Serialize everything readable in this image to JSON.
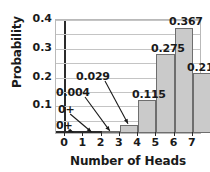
{
  "chart_data": {
    "type": "bar",
    "title": "",
    "xlabel": "Number of Heads",
    "ylabel": "Probability",
    "categories": [
      "0",
      "1",
      "2",
      "3",
      "4",
      "5",
      "6",
      "7"
    ],
    "values": [
      0,
      0,
      0.004,
      0.029,
      0.115,
      0.275,
      0.367,
      0.21
    ],
    "value_labels": [
      "0+",
      "0+",
      "0.004",
      "0.029",
      "0.115",
      "0.275",
      "0.367",
      "0.210"
    ],
    "ylim": [
      0,
      0.4
    ],
    "yticks": [
      0.1,
      0.2,
      0.3,
      0.4
    ],
    "ytick_labels": [
      "0.1",
      "0.2",
      "0.3",
      "0.4"
    ],
    "gridlines": [
      0.05,
      0.1,
      0.15,
      0.2,
      0.25,
      0.3,
      0.35,
      0.4
    ],
    "grid": true,
    "legend": "none",
    "bar_fill": "#cacaca",
    "bar_edge": "#6e6e6e",
    "axis_color": "#2b2b2b",
    "annotations": [
      {
        "text": "0+",
        "points_to": "0"
      },
      {
        "text": "0+",
        "points_to": "1"
      },
      {
        "text": "0.004",
        "points_to": "2"
      },
      {
        "text": "0.029",
        "points_to": "3"
      }
    ],
    "direct_labels": [
      {
        "text": "0.115",
        "category": "4"
      },
      {
        "text": "0.275",
        "category": "5"
      },
      {
        "text": "0.367",
        "category": "6"
      },
      {
        "text": "0.210",
        "category": "7"
      }
    ]
  }
}
